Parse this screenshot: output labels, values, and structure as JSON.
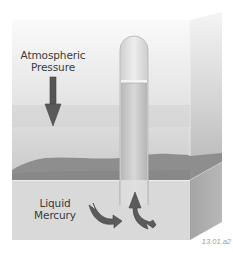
{
  "figure": {
    "labels": {
      "atmospheric_line1": "Atmospheric",
      "atmospheric_line2": "Pressure",
      "mercury_line1": "Liquid",
      "mercury_line2": "Mercury"
    },
    "figure_id": "13.01.a2",
    "icons": {
      "down_arrow": "arrow-down-icon",
      "curved_arrow_left": "curved-arrow-right-icon",
      "curved_arrow_up": "curved-arrow-up-icon"
    },
    "colors": {
      "background": "#ffffff",
      "back_wall_top": "#f3f3f3",
      "back_wall_bottom": "#bdbdbd",
      "mercury_surface": "#8f8f8f",
      "front_face": "#d6d6d6",
      "side_face": "#a9a9a9",
      "tube_glass": "#ebebeb",
      "tube_mercury": "#c9c9c9",
      "arrow_fill": "#555555",
      "label_text": "#3a3a3a"
    }
  }
}
